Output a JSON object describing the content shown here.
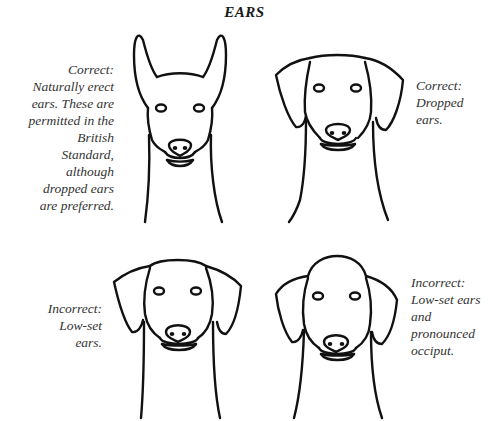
{
  "title": "EARS",
  "panels": [
    {
      "id": "erect",
      "verdict": "Correct:",
      "caption_lines": [
        "Correct:",
        "Naturally erect",
        "ears. These are",
        "permitted in the",
        "British",
        "Standard,",
        "although",
        "dropped ears",
        "are preferred."
      ]
    },
    {
      "id": "dropped",
      "verdict": "Correct:",
      "caption_lines": [
        "Correct:",
        "Dropped",
        "ears."
      ]
    },
    {
      "id": "low-set",
      "verdict": "Incorrect:",
      "caption_lines": [
        "Incorrect:",
        "Low-set",
        "ears."
      ]
    },
    {
      "id": "low-set-occiput",
      "verdict": "Incorrect:",
      "caption_lines": [
        "Incorrect:",
        "Low-set ears",
        "and",
        "pronounced",
        "occiput."
      ]
    }
  ],
  "colors": {
    "ink": "#111111",
    "text": "#333333",
    "background": "#ffffff"
  }
}
